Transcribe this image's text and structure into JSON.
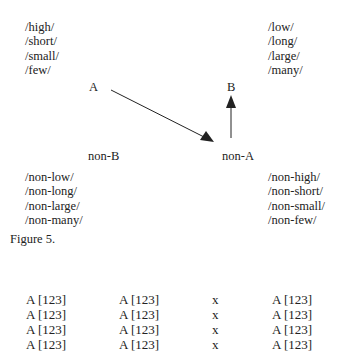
{
  "figure": {
    "top_left_list": [
      "/high/",
      "/short/",
      "/small/",
      "/few/"
    ],
    "top_right_list": [
      "/low/",
      "/long/",
      "/large/",
      "/many/"
    ],
    "node_a": "A",
    "node_b": "B",
    "node_non_b": "non-B",
    "node_non_a": "non-A",
    "bottom_left_list": [
      "/non-low/",
      "/non-long/",
      "/non-large/",
      "/non-many/"
    ],
    "bottom_right_list": [
      "/non-high/",
      "/non-short/",
      "/non-small/",
      "/non-few/"
    ],
    "caption": "Figure 5."
  },
  "table": {
    "rows": [
      [
        "A [123]",
        "A [123]",
        "x",
        "A [123]"
      ],
      [
        "A [123]",
        "A [123]",
        "x",
        "A [123]"
      ],
      [
        "A [123]",
        "A [123]",
        "x",
        "A [123]"
      ],
      [
        "A [123]",
        "A [123]",
        "x",
        "A [123]"
      ]
    ]
  }
}
